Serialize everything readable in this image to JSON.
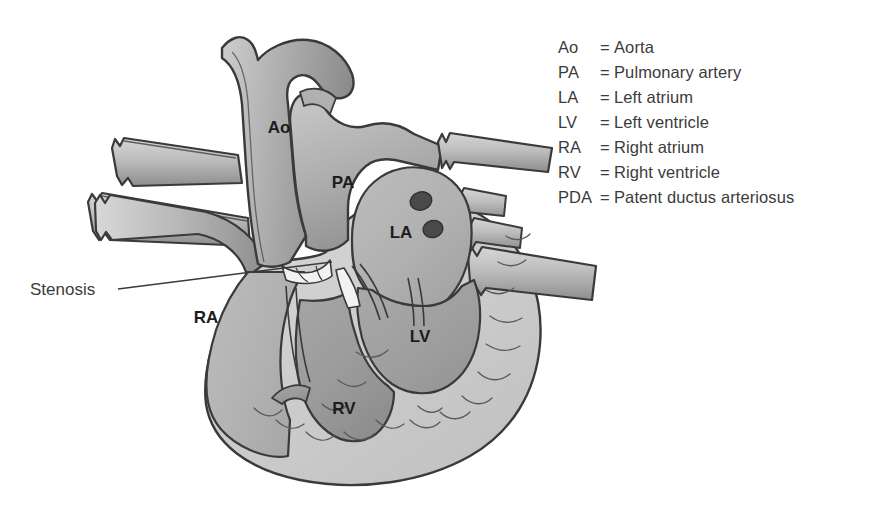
{
  "figure": {
    "background_color": "#ffffff"
  },
  "legend": {
    "entries": [
      {
        "abbr": "Ao",
        "eq": "=",
        "term": "Aorta"
      },
      {
        "abbr": "PA",
        "eq": "=",
        "term": "Pulmonary artery"
      },
      {
        "abbr": "LA",
        "eq": "=",
        "term": "Left atrium"
      },
      {
        "abbr": "LV",
        "eq": "=",
        "term": "Left ventricle"
      },
      {
        "abbr": "RA",
        "eq": "=",
        "term": "Right atrium"
      },
      {
        "abbr": "RV",
        "eq": "=",
        "term": "Right ventricle"
      },
      {
        "abbr": "PDA",
        "eq": "=",
        "term": "Patent ductus arteriosus"
      }
    ],
    "text_color": "#3b3b3b"
  },
  "callouts": [
    {
      "label": "Stenosis",
      "leader_from_x": 118,
      "leader_from_y": 289,
      "leader_to_x": 332,
      "leader_to_y": 262
    }
  ],
  "diagram_labels": [
    {
      "name": "Ao",
      "x": 279,
      "y": 133
    },
    {
      "name": "PA",
      "x": 343,
      "y": 188
    },
    {
      "name": "LA",
      "x": 401,
      "y": 238
    },
    {
      "name": "LV",
      "x": 420,
      "y": 342
    },
    {
      "name": "RA",
      "x": 206,
      "y": 323
    },
    {
      "name": "RV",
      "x": 344,
      "y": 414
    }
  ],
  "colors": {
    "outline": "#3a3a3a",
    "myocardium": "#cfcfcf",
    "atrium_cavity": "#b4b4b4",
    "ventricle_cavity": "#9e9e9e",
    "vessel_light": "#c8c8c8",
    "vessel_dark": "#909090",
    "vein_opening": "#4a4a4a",
    "valve_leaflet": "#f2f2f2",
    "label_text": "#1c1c1c",
    "legend_text": "#3b3b3b",
    "background": "#ffffff"
  }
}
